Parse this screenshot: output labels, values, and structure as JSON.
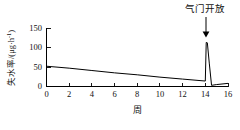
{
  "chart_data": {
    "type": "line",
    "title": "",
    "xlabel": "周",
    "ylabel": "失水率/(μg·h⁻¹)",
    "ylabel_parts": {
      "name": "失水率",
      "slash": "/(",
      "unit": "μg·h",
      "exponent": "-1",
      "close": ")"
    },
    "xlim": [
      0,
      16
    ],
    "ylim": [
      0,
      150
    ],
    "xticks": [
      0,
      2,
      4,
      6,
      8,
      10,
      12,
      14,
      16
    ],
    "xtick_labels": [
      "0",
      "2",
      "4",
      "6",
      "8",
      "10",
      "12",
      "14",
      "16"
    ],
    "yticks": [
      0,
      50,
      100,
      150
    ],
    "ytick_labels": [
      "0",
      "50",
      "100",
      "150"
    ],
    "grid": false,
    "legend": null,
    "tick_direction": "in",
    "spines": [
      "left",
      "bottom"
    ],
    "line_color": "#000000",
    "background_color": "#ffffff",
    "series": [
      {
        "name": "失水率",
        "x": [
          0,
          2,
          4,
          6,
          8,
          10,
          12,
          14,
          14.08,
          14.18,
          14.35,
          14.55,
          15.0,
          16
        ],
        "values": [
          52,
          47,
          41,
          35,
          30,
          24,
          19,
          14,
          113,
          112,
          60,
          3,
          5,
          8
        ]
      }
    ],
    "annotations": [
      {
        "text": "气门开放",
        "x": 14.1,
        "y": 150,
        "arrow": "down",
        "points_to_x": 14.1,
        "points_to_y": 118
      }
    ]
  }
}
